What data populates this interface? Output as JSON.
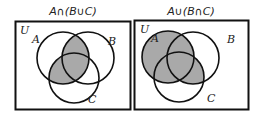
{
  "colors": {
    "shade": "#a9a9a9",
    "stroke": "#111111",
    "background": "#ffffff"
  },
  "panels": [
    {
      "title": "A∩(B∪C)",
      "universe_label": "U",
      "sets": {
        "A": "A",
        "B": "B",
        "C": "C"
      }
    },
    {
      "title": "A∪(B∩C)",
      "universe_label": "U",
      "sets": {
        "A": "A",
        "B": "B",
        "C": "C"
      }
    }
  ]
}
